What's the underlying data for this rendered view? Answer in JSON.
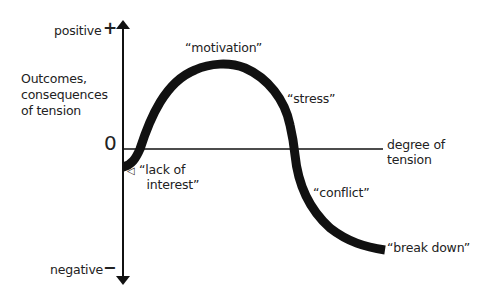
{
  "diagram": {
    "y_axis": {
      "title": "Outcomes,\nconsequences\nof tension",
      "top_label": "positive",
      "top_sign": "+",
      "bottom_label": "negative",
      "bottom_sign": "−",
      "origin_label": "0"
    },
    "x_axis": {
      "title": "degree of\ntension"
    },
    "curve_labels": {
      "lack_of_interest": "“lack of\n  interest”",
      "motivation": "“motivation”",
      "stress": "“stress”",
      "conflict": "“conflict”",
      "break_down": "“break down”"
    },
    "pointer_glyph": "◁"
  },
  "colors": {
    "line": "#111111",
    "background": "#ffffff"
  }
}
